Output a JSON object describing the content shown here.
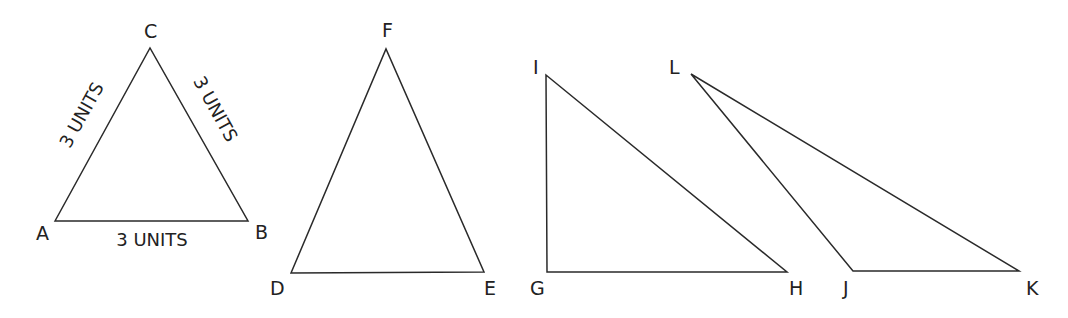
{
  "figure": {
    "triangles": [
      {
        "id": "ABC",
        "vertices": [
          "A",
          "B",
          "C"
        ],
        "side_labels": {
          "AC": "3 UNITS",
          "CB": "3 UNITS",
          "AB": "3 UNITS"
        }
      },
      {
        "id": "DEF",
        "vertices": [
          "D",
          "E",
          "F"
        ],
        "side_labels": {}
      },
      {
        "id": "GHI",
        "vertices": [
          "G",
          "H",
          "I"
        ],
        "side_labels": {}
      },
      {
        "id": "JKL",
        "vertices": [
          "J",
          "K",
          "L"
        ],
        "side_labels": {}
      }
    ]
  },
  "labels": {
    "A": "A",
    "B": "B",
    "C": "C",
    "D": "D",
    "E": "E",
    "F": "F",
    "G": "G",
    "H": "H",
    "I": "I",
    "J": "J",
    "K": "K",
    "L": "L",
    "side_AC": "3 UNITS",
    "side_CB": "3 UNITS",
    "side_AB": "3 UNITS"
  }
}
